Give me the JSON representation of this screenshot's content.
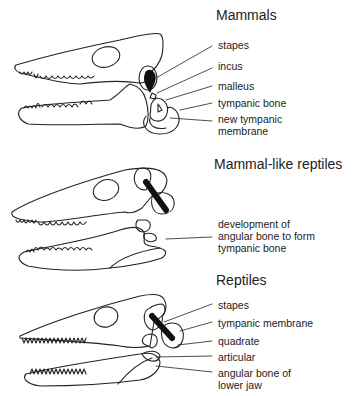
{
  "panels": [
    {
      "title": "Mammals",
      "labels": [
        {
          "text": "stapes"
        },
        {
          "text": "incus"
        },
        {
          "text": "malleus"
        },
        {
          "text": "tympanic bone"
        },
        {
          "text": "new tympanic"
        },
        {
          "text": "membrane"
        }
      ]
    },
    {
      "title": "Mammal-like reptiles",
      "labels": [
        {
          "text": "development of"
        },
        {
          "text": "angular bone to form"
        },
        {
          "text": "tympanic bone"
        }
      ]
    },
    {
      "title": "Reptiles",
      "labels": [
        {
          "text": "stapes"
        },
        {
          "text": "tympanic membrane"
        },
        {
          "text": "quadrate"
        },
        {
          "text": "articular"
        },
        {
          "text": "angular bone of"
        },
        {
          "text": "lower jaw"
        }
      ]
    }
  ]
}
